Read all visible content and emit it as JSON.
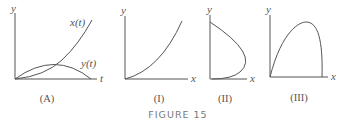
{
  "figure": {
    "title": "FIGURE 15",
    "panels": [
      {
        "id": "A",
        "caption": "(A)",
        "axes": {
          "x_label": "t",
          "y_label": "y"
        },
        "curve_labels": [
          "x(t)",
          "y(t)"
        ]
      },
      {
        "id": "I",
        "caption": "(I)",
        "axes": {
          "x_label": "x",
          "y_label": "y"
        }
      },
      {
        "id": "II",
        "caption": "(II)",
        "axes": {
          "x_label": "x",
          "y_label": "y"
        }
      },
      {
        "id": "III",
        "caption": "(III)",
        "axes": {
          "x_label": "x",
          "y_label": "y"
        }
      }
    ]
  },
  "colors": {
    "line": "#555555",
    "caption": "#777777"
  }
}
